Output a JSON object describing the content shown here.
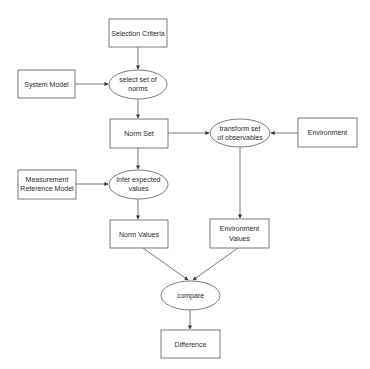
{
  "diagram": {
    "nodes": {
      "selection_criteria": {
        "shape": "box",
        "lines": [
          "Selection Criteria"
        ]
      },
      "system_model": {
        "shape": "box",
        "lines": [
          "System Model"
        ]
      },
      "select_set_of_norms": {
        "shape": "ellipse",
        "lines": [
          "select set of",
          "norms"
        ]
      },
      "norm_set": {
        "shape": "box",
        "lines": [
          "Norm Set"
        ]
      },
      "transform_set_of_observables": {
        "shape": "ellipse",
        "lines": [
          "transform set",
          "of observables"
        ]
      },
      "environment": {
        "shape": "box",
        "lines": [
          "Environment"
        ]
      },
      "measurement_reference_model": {
        "shape": "box",
        "lines": [
          "Measurement",
          "Reference Model"
        ]
      },
      "infer_expected_values": {
        "shape": "ellipse",
        "lines": [
          "infer expected",
          "values"
        ]
      },
      "norm_values": {
        "shape": "box",
        "lines": [
          "Norm Values"
        ]
      },
      "environment_values": {
        "shape": "box",
        "lines": [
          "Environment",
          "Values"
        ]
      },
      "compare": {
        "shape": "ellipse",
        "lines": [
          "compare"
        ]
      },
      "difference": {
        "shape": "box",
        "lines": [
          "Difference"
        ]
      }
    },
    "edges": [
      {
        "from": "selection_criteria",
        "to": "select_set_of_norms"
      },
      {
        "from": "system_model",
        "to": "select_set_of_norms"
      },
      {
        "from": "select_set_of_norms",
        "to": "norm_set"
      },
      {
        "from": "norm_set",
        "to": "transform_set_of_observables"
      },
      {
        "from": "environment",
        "to": "transform_set_of_observables"
      },
      {
        "from": "norm_set",
        "to": "infer_expected_values"
      },
      {
        "from": "measurement_reference_model",
        "to": "infer_expected_values"
      },
      {
        "from": "infer_expected_values",
        "to": "norm_values"
      },
      {
        "from": "transform_set_of_observables",
        "to": "environment_values"
      },
      {
        "from": "norm_values",
        "to": "compare"
      },
      {
        "from": "environment_values",
        "to": "compare"
      },
      {
        "from": "compare",
        "to": "difference"
      }
    ]
  }
}
